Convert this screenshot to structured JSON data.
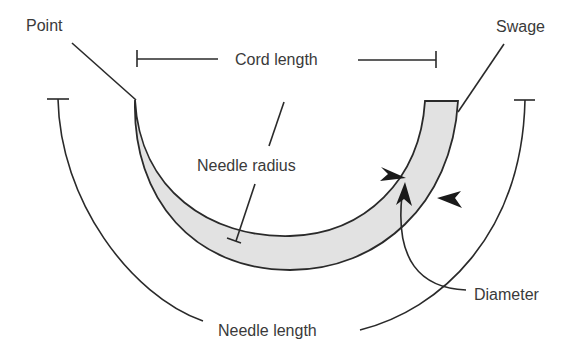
{
  "diagram": {
    "labels": {
      "point": "Point",
      "swage": "Swage",
      "cord_length": "Cord length",
      "needle_radius": "Needle radius",
      "diameter": "Diameter",
      "needle_length": "Needle length"
    },
    "colors": {
      "needle_fill": "#e2e2e2",
      "stroke": "#2a2a2a",
      "text": "#3a3a3a"
    }
  }
}
